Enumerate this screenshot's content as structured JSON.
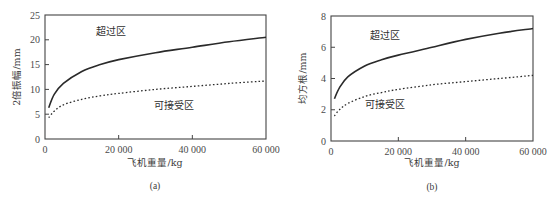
{
  "chart_data": [
    {
      "type": "line",
      "caption": "(a)",
      "title": "",
      "xlabel": "飞机重量/kg",
      "ylabel": "2倍振幅/mm",
      "xlim": [
        0,
        60000
      ],
      "ylim": [
        0,
        25
      ],
      "xticks": [
        0,
        20000,
        40000,
        60000
      ],
      "xtick_labels": [
        "0",
        "20 000",
        "40 000",
        "60 000"
      ],
      "yticks": [
        0,
        5,
        10,
        15,
        20,
        25
      ],
      "ytick_labels": [
        "0",
        "5",
        "10",
        "15",
        "20",
        "25"
      ],
      "grid": false,
      "annotations": [
        {
          "text": "超过区",
          "x": 18000,
          "y": 21
        },
        {
          "text": "可接受区",
          "x": 35000,
          "y": 6
        }
      ],
      "x": [
        1000,
        2500,
        5000,
        10000,
        15000,
        20000,
        30000,
        40000,
        50000,
        60000
      ],
      "series": [
        {
          "name": "upper limit (solid)",
          "style": "solid",
          "values": [
            6.3,
            9.0,
            11.2,
            13.6,
            15.0,
            16.0,
            17.4,
            18.5,
            19.6,
            20.5
          ]
        },
        {
          "name": "acceptable limit (dotted)",
          "style": "dotted",
          "values": [
            4.3,
            5.6,
            6.9,
            8.0,
            8.7,
            9.2,
            10.0,
            10.6,
            11.2,
            11.7
          ]
        }
      ]
    },
    {
      "type": "line",
      "caption": "(b)",
      "title": "",
      "xlabel": "飞机重量/kg",
      "ylabel": "均方根/mm",
      "xlim": [
        0,
        60000
      ],
      "ylim": [
        0,
        8
      ],
      "xticks": [
        0,
        20000,
        40000,
        60000
      ],
      "xtick_labels": [
        "0",
        "20 000",
        "40 000",
        "60 000"
      ],
      "yticks": [
        0,
        2,
        4,
        6,
        8
      ],
      "ytick_labels": [
        "0",
        "2",
        "4",
        "6",
        "8"
      ],
      "grid": false,
      "annotations": [
        {
          "text": "超过区",
          "x": 16000,
          "y": 6.5
        },
        {
          "text": "可接受区",
          "x": 16000,
          "y": 2.1
        }
      ],
      "x": [
        1000,
        2500,
        5000,
        10000,
        15000,
        20000,
        30000,
        40000,
        50000,
        60000
      ],
      "series": [
        {
          "name": "upper limit (solid)",
          "style": "solid",
          "values": [
            2.7,
            3.4,
            4.1,
            4.8,
            5.2,
            5.5,
            6.0,
            6.5,
            6.9,
            7.2
          ]
        },
        {
          "name": "acceptable limit (dotted)",
          "style": "dotted",
          "values": [
            1.6,
            2.0,
            2.4,
            2.85,
            3.1,
            3.3,
            3.6,
            3.8,
            4.0,
            4.2
          ]
        }
      ]
    }
  ]
}
